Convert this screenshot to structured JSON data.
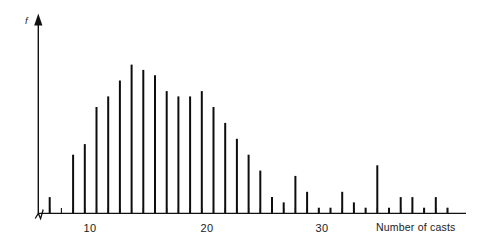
{
  "chart_data": {
    "type": "bar",
    "title": "",
    "subtitle": "",
    "xlabel": "Number of casts",
    "ylabel": "f",
    "grid": false,
    "legend": null,
    "axis_break_at_origin": true,
    "xlim": [
      4,
      40
    ],
    "ylim": [
      0,
      30
    ],
    "xticks": [
      5,
      6,
      7,
      8,
      9,
      10,
      11,
      12,
      13,
      14,
      15,
      16,
      17,
      18,
      19,
      20,
      21,
      22,
      23,
      24,
      25,
      26,
      27,
      28,
      29,
      30,
      31,
      32,
      33,
      34,
      35,
      36,
      37,
      38,
      39
    ],
    "xtick_labels": [
      {
        "value": 10,
        "label": "10"
      },
      {
        "value": 20,
        "label": "20"
      },
      {
        "value": 30,
        "label": "30"
      }
    ],
    "categories": [
      5,
      6,
      7,
      8,
      9,
      10,
      11,
      12,
      13,
      14,
      15,
      16,
      17,
      18,
      19,
      20,
      21,
      22,
      23,
      24,
      25,
      26,
      27,
      28,
      29,
      30,
      31,
      32,
      33,
      34,
      35,
      36,
      37,
      38,
      39
    ],
    "values": [
      3,
      0,
      11,
      13,
      20,
      22,
      25,
      28,
      27,
      26,
      23,
      22,
      22,
      23,
      20,
      17,
      14,
      11,
      8,
      3,
      2,
      7,
      4,
      1,
      1,
      4,
      2,
      1,
      9,
      1,
      3,
      3,
      1,
      3,
      1
    ]
  },
  "labels": {
    "y_axis_symbol": "f",
    "x_axis_caption": "Number of casts",
    "tick_10": "10",
    "tick_20": "20",
    "tick_30": "30"
  },
  "colors": {
    "spike": "#0d0d0d",
    "axis": "#111111",
    "background": "#ffffff",
    "text": "#1a1a1a"
  },
  "geometry": {
    "baseline_y": 213,
    "y_axis_x": 38,
    "y_axis_top": 15,
    "x_axis_right": 466,
    "px_per_unit": 11.7,
    "x_origin_value": 4,
    "px_per_freq_unit": 5.3,
    "tick_height": 5,
    "spike_width": 2.0
  }
}
